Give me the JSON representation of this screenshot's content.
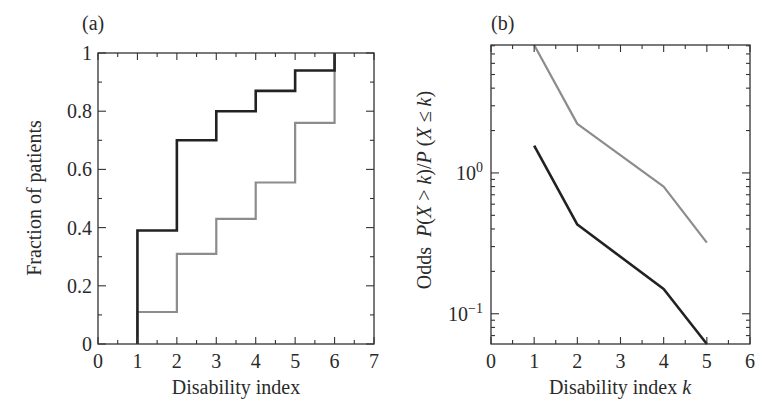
{
  "figure": {
    "panels": [
      "(a)",
      "(b)"
    ]
  },
  "series_styles": {
    "dark": {
      "color": "#222222",
      "width": 2.6
    },
    "light": {
      "color": "#8c8c8c",
      "width": 2.2
    }
  },
  "chart_data": [
    {
      "type": "line",
      "subtype": "step",
      "panel_label": "(a)",
      "title": "",
      "xlabel": "Disability index",
      "ylabel": "Fraction of patients",
      "xlim": [
        0,
        7
      ],
      "ylim": [
        0,
        1
      ],
      "xticks": [
        0,
        1,
        2,
        3,
        4,
        5,
        6,
        7
      ],
      "xtick_labels": [
        "0",
        "1",
        "2",
        "3",
        "4",
        "5",
        "6",
        "7"
      ],
      "yticks": [
        0,
        0.2,
        0.4,
        0.6,
        0.8,
        1
      ],
      "ytick_labels": [
        "0",
        "0.2",
        "0.4",
        "0.6",
        "0.8",
        "1"
      ],
      "grid": false,
      "legend": null,
      "series": [
        {
          "name": "dark",
          "x": [
            1,
            2,
            3,
            4,
            5,
            6
          ],
          "values": [
            0.39,
            0.7,
            0.8,
            0.87,
            0.94,
            1.0
          ]
        },
        {
          "name": "light",
          "x": [
            1,
            2,
            3,
            4,
            5,
            6
          ],
          "values": [
            0.11,
            0.31,
            0.43,
            0.555,
            0.76,
            1.0
          ]
        }
      ]
    },
    {
      "type": "line",
      "panel_label": "(b)",
      "title": "",
      "xlabel": "Disability index k",
      "ylabel": "Odds P(X > k)/P (X ≤ k)",
      "yscale": "log",
      "xlim": [
        0,
        6
      ],
      "ylim": [
        0.061,
        8.1
      ],
      "xticks": [
        0,
        1,
        2,
        3,
        4,
        5,
        6
      ],
      "xtick_labels": [
        "0",
        "1",
        "2",
        "3",
        "4",
        "5",
        "6"
      ],
      "yticks": [
        0.1,
        1
      ],
      "ytick_labels": [
        "10^-1",
        "10^0"
      ],
      "grid": false,
      "legend": null,
      "series": [
        {
          "name": "dark",
          "x": [
            1,
            2,
            4,
            5
          ],
          "values": [
            1.56,
            0.43,
            0.15,
            0.061
          ]
        },
        {
          "name": "light",
          "x": [
            1,
            2,
            4,
            5
          ],
          "values": [
            8.1,
            2.23,
            0.8,
            0.32
          ]
        }
      ]
    }
  ]
}
